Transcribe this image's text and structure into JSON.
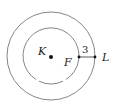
{
  "diagram": {
    "type": "concentric-circles",
    "center_label": "K",
    "inner_point_label": "F",
    "outer_point_label": "L",
    "segment_length": "3",
    "colors": {
      "stroke": "#555555",
      "text": "#222222",
      "point": "#111111"
    }
  }
}
